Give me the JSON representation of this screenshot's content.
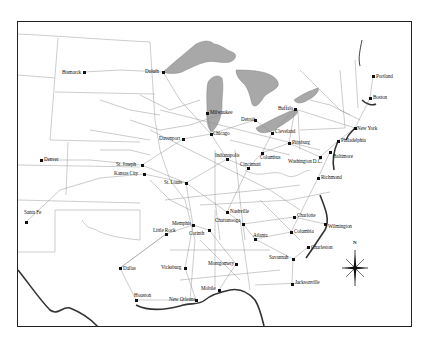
{
  "map": {
    "subject": "Railroad network of the eastern United States",
    "colors": {
      "background": "#ffffff",
      "frame": "#222222",
      "lakes": "#a8a8a8",
      "rail_lines": "#8a8a8a",
      "borders": "#9a9a9a",
      "coast": "#333333",
      "text": "#111111"
    },
    "compass": {
      "label": "N"
    },
    "cities": [
      {
        "name": "Bismarck",
        "x": 84,
        "y": 72,
        "label_dx": -22,
        "label_dy": -2
      },
      {
        "name": "Duluth",
        "x": 163,
        "y": 72,
        "label_dx": -18,
        "label_dy": -3
      },
      {
        "name": "Portland",
        "x": 373,
        "y": 76,
        "label_dx": 3,
        "label_dy": -2
      },
      {
        "name": "Boston",
        "x": 370,
        "y": 98,
        "label_dx": 3,
        "label_dy": -3
      },
      {
        "name": "Milwaukee",
        "x": 207,
        "y": 113,
        "label_dx": 3,
        "label_dy": -3
      },
      {
        "name": "Detroit",
        "x": 255,
        "y": 120,
        "label_dx": -14,
        "label_dy": -3
      },
      {
        "name": "Buffalo",
        "x": 295,
        "y": 109,
        "label_dx": -17,
        "label_dy": -3
      },
      {
        "name": "New York",
        "x": 355,
        "y": 128,
        "label_dx": 2,
        "label_dy": -2
      },
      {
        "name": "Cleveland",
        "x": 272,
        "y": 133,
        "label_dx": 3,
        "label_dy": -4
      },
      {
        "name": "Chicago",
        "x": 211,
        "y": 134,
        "label_dx": 2,
        "label_dy": -3
      },
      {
        "name": "Davenport",
        "x": 183,
        "y": 139,
        "label_dx": -24,
        "label_dy": -3
      },
      {
        "name": "Pittsburg",
        "x": 289,
        "y": 143,
        "label_dx": 3,
        "label_dy": -3
      },
      {
        "name": "Philadelphia",
        "x": 338,
        "y": 141,
        "label_dx": 3,
        "label_dy": -3
      },
      {
        "name": "Columbus",
        "x": 262,
        "y": 153,
        "label_dx": -2,
        "label_dy": 2
      },
      {
        "name": "Indianapolis",
        "x": 227,
        "y": 159,
        "label_dx": -12,
        "label_dy": -6
      },
      {
        "name": "Washington D.C.",
        "x": 320,
        "y": 157,
        "label_dx": -32,
        "label_dy": 2
      },
      {
        "name": "Baltimore",
        "x": 330,
        "y": 152,
        "label_dx": 3,
        "label_dy": 2
      },
      {
        "name": "Cincinnati",
        "x": 248,
        "y": 168,
        "label_dx": -8,
        "label_dy": -6
      },
      {
        "name": "Denver",
        "x": 41,
        "y": 160,
        "label_dx": 3,
        "label_dy": -3
      },
      {
        "name": "St. Joseph",
        "x": 142,
        "y": 165,
        "label_dx": -26,
        "label_dy": -3
      },
      {
        "name": "Kansas City",
        "x": 144,
        "y": 174,
        "label_dx": -30,
        "label_dy": -3
      },
      {
        "name": "St. Louis",
        "x": 186,
        "y": 183,
        "label_dx": -22,
        "label_dy": -3
      },
      {
        "name": "Richmond",
        "x": 318,
        "y": 178,
        "label_dx": 3,
        "label_dy": -3
      },
      {
        "name": "Santa Fe",
        "x": 26,
        "y": 222,
        "label_dx": -2,
        "label_dy": -12
      },
      {
        "name": "Nashville",
        "x": 227,
        "y": 212,
        "label_dx": 3,
        "label_dy": -3
      },
      {
        "name": "Charlotte",
        "x": 294,
        "y": 217,
        "label_dx": 3,
        "label_dy": -4
      },
      {
        "name": "Memphis",
        "x": 193,
        "y": 225,
        "label_dx": -21,
        "label_dy": -4
      },
      {
        "name": "Chattanooga",
        "x": 243,
        "y": 224,
        "label_dx": -28,
        "label_dy": -6
      },
      {
        "name": "Corinth",
        "x": 209,
        "y": 230,
        "label_dx": -20,
        "label_dy": 1
      },
      {
        "name": "Columbia",
        "x": 291,
        "y": 232,
        "label_dx": 3,
        "label_dy": -3
      },
      {
        "name": "Wilmington",
        "x": 325,
        "y": 224,
        "label_dx": 3,
        "label_dy": 0
      },
      {
        "name": "Little Rock",
        "x": 166,
        "y": 234,
        "label_dx": -13,
        "label_dy": -6
      },
      {
        "name": "Atlanta",
        "x": 255,
        "y": 239,
        "label_dx": -2,
        "label_dy": -6
      },
      {
        "name": "Charleston",
        "x": 308,
        "y": 247,
        "label_dx": 3,
        "label_dy": -2
      },
      {
        "name": "Dallas",
        "x": 120,
        "y": 268,
        "label_dx": 3,
        "label_dy": -2
      },
      {
        "name": "Vicksburg",
        "x": 185,
        "y": 268,
        "label_dx": -24,
        "label_dy": -3
      },
      {
        "name": "Montgomery",
        "x": 236,
        "y": 264,
        "label_dx": -28,
        "label_dy": -3
      },
      {
        "name": "Savannah",
        "x": 293,
        "y": 259,
        "label_dx": -24,
        "label_dy": -4
      },
      {
        "name": "Jacksonville",
        "x": 292,
        "y": 284,
        "label_dx": 3,
        "label_dy": -4
      },
      {
        "name": "Mobile",
        "x": 219,
        "y": 290,
        "label_dx": -18,
        "label_dy": -4
      },
      {
        "name": "Houston",
        "x": 136,
        "y": 300,
        "label_dx": -2,
        "label_dy": -7
      },
      {
        "name": "New Orleans",
        "x": 196,
        "y": 300,
        "label_dx": -27,
        "label_dy": -3
      }
    ]
  }
}
